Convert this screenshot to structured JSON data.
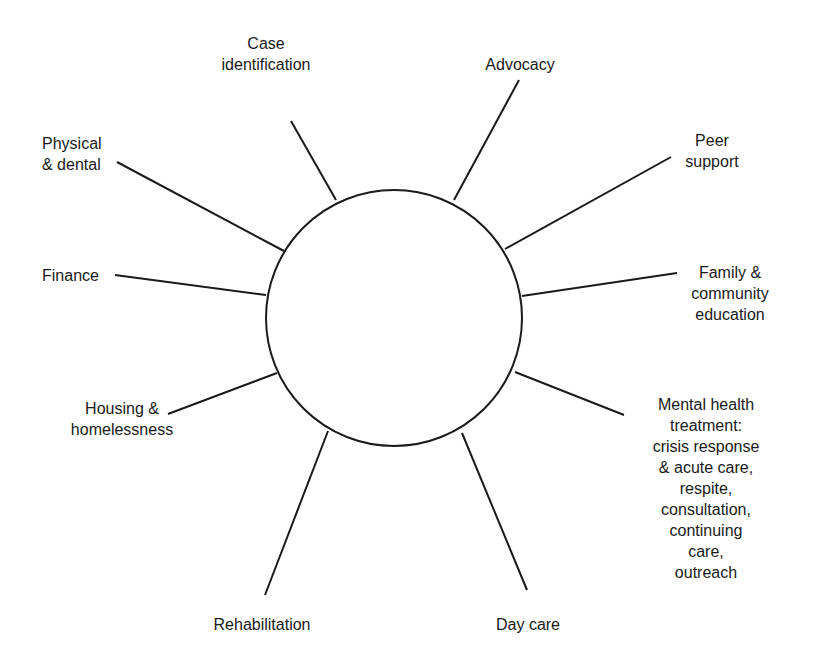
{
  "diagram": {
    "center": {
      "label": ""
    },
    "spokes": [
      {
        "id": "case-identification",
        "label": "Case\nidentification"
      },
      {
        "id": "advocacy",
        "label": "Advocacy"
      },
      {
        "id": "peer-support",
        "label": "Peer\nsupport"
      },
      {
        "id": "family-community-education",
        "label": "Family &\ncommunity\neducation"
      },
      {
        "id": "mental-health-treatment",
        "label": "Mental health\ntreatment:\ncrisis response\n& acute care,\nrespite, consultation,\ncontinuing care,\noutreach"
      },
      {
        "id": "day-care",
        "label": "Day care"
      },
      {
        "id": "rehabilitation",
        "label": "Rehabilitation"
      },
      {
        "id": "housing-homelessness",
        "label": "Housing &\nhomelessness"
      },
      {
        "id": "finance",
        "label": "Finance"
      },
      {
        "id": "physical-dental",
        "label": "Physical\n& dental"
      }
    ]
  },
  "colors": {
    "stroke": "#1a1a1a",
    "background": "#ffffff",
    "text": "#1a1a1a"
  }
}
